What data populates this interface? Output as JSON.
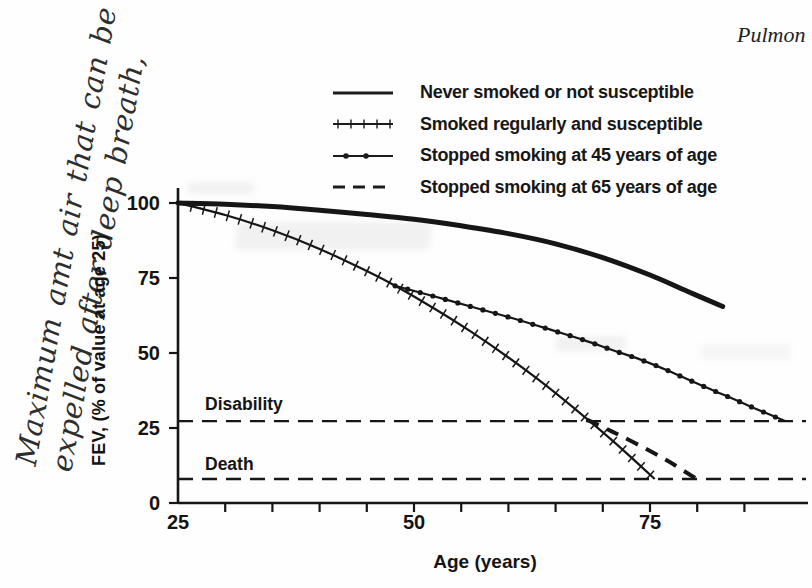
{
  "page": {
    "header_fragment": "Pulmon",
    "handwritten_note": {
      "line1": "Maximum amt air that can be",
      "line2": "expelled after deep breath,"
    }
  },
  "chart_data": {
    "type": "line",
    "title": "",
    "xlabel": "Age (years)",
    "ylabel": "FEV, (% of value at age 25)",
    "xlim": [
      25,
      92
    ],
    "ylim": [
      0,
      105
    ],
    "x_ticks": [
      25,
      50,
      75
    ],
    "x_minor_tick_step": 5,
    "x_minor_tick_range": [
      30,
      85
    ],
    "y_ticks": [
      100,
      75,
      50,
      25,
      0
    ],
    "grid": false,
    "legend_position": "top",
    "guides": [
      {
        "label": "Disability",
        "value": 27.3
      },
      {
        "label": "Death",
        "value": 8
      }
    ],
    "series": [
      {
        "name": "never_smoked",
        "label": "Never smoked or not susceptible",
        "style": "solid_thick",
        "points": [
          [
            25,
            100
          ],
          [
            30,
            99.6
          ],
          [
            35,
            98.8
          ],
          [
            40,
            97.6
          ],
          [
            45,
            96.2
          ],
          [
            50,
            94.6
          ],
          [
            55,
            92.4
          ],
          [
            60,
            89.8
          ],
          [
            65,
            86.4
          ],
          [
            70,
            81.8
          ],
          [
            75,
            76
          ],
          [
            79,
            70.5
          ],
          [
            82.7,
            65.5
          ]
        ]
      },
      {
        "name": "smoked_regularly",
        "label": "Smoked regularly and susceptible",
        "style": "hatched",
        "points": [
          [
            25,
            100
          ],
          [
            30,
            96
          ],
          [
            35,
            90.9
          ],
          [
            40,
            84.7
          ],
          [
            45,
            77.3
          ],
          [
            48,
            72.4
          ],
          [
            52,
            65.1
          ],
          [
            56,
            57.2
          ],
          [
            60,
            48.5
          ],
          [
            64,
            39.1
          ],
          [
            68,
            28.9
          ],
          [
            71,
            20.9
          ],
          [
            73.5,
            13.8
          ],
          [
            75.5,
            8
          ]
        ]
      },
      {
        "name": "stopped_at_45",
        "label": "Stopped smoking at 45 years of age",
        "style": "dot_markers",
        "points": [
          [
            48,
            72.4
          ],
          [
            52,
            69
          ],
          [
            56,
            65.5
          ],
          [
            60,
            62
          ],
          [
            64,
            58.2
          ],
          [
            68,
            54.3
          ],
          [
            71,
            51
          ],
          [
            74,
            47.8
          ],
          [
            77,
            44
          ],
          [
            80,
            39.8
          ],
          [
            83,
            35.8
          ],
          [
            86,
            31.7
          ],
          [
            89.3,
            27.3
          ]
        ]
      },
      {
        "name": "stopped_at_65",
        "label": "Stopped smoking at 65 years of age",
        "style": "dashed_bold",
        "points": [
          [
            68.3,
            27.8
          ],
          [
            71,
            23.8
          ],
          [
            74,
            19
          ],
          [
            77,
            13.8
          ],
          [
            79.8,
            8.3
          ]
        ]
      }
    ]
  }
}
